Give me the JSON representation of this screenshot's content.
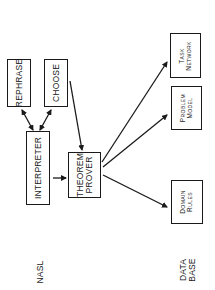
{
  "diagram": {
    "orientation": "rotated-90-ccw",
    "nodes": {
      "rephrase": {
        "label": "REPHRASE"
      },
      "choose": {
        "label": "CHOOSE"
      },
      "interpreter": {
        "label": "INTERPRETER"
      },
      "theorem_prover": {
        "line1": "THEOREM",
        "line2": "PROVER"
      },
      "task_network": {
        "line1": "Task",
        "line2": "Network"
      },
      "problem_model": {
        "line1": "Problem",
        "line2": "Model"
      },
      "domain_rules": {
        "line1": "Domain",
        "line2": "Rules"
      }
    },
    "row_labels": {
      "nasl": "NASL",
      "database_line1": "DATA",
      "database_line2": "BASE"
    },
    "edges": [
      {
        "from": "interpreter",
        "to": "rephrase",
        "bidirectional": true
      },
      {
        "from": "interpreter",
        "to": "choose",
        "bidirectional": true
      },
      {
        "from": "interpreter",
        "to": "theorem_prover"
      },
      {
        "from": "choose",
        "to": "theorem_prover"
      },
      {
        "from": "theorem_prover",
        "to": "task_network"
      },
      {
        "from": "theorem_prover",
        "to": "problem_model"
      },
      {
        "from": "theorem_prover",
        "to": "domain_rules"
      }
    ]
  }
}
